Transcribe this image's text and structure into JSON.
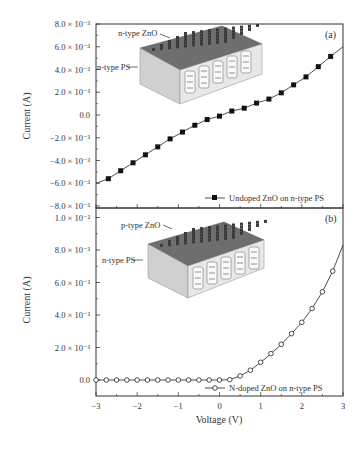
{
  "chart_data": [
    {
      "type": "line",
      "panel_label": "(a)",
      "title": "",
      "xlabel": "Voltage (V)",
      "ylabel": "Current (A)",
      "xlim": [
        -3,
        3
      ],
      "ylim": [
        -0.008,
        0.008
      ],
      "y_ticks": [
        {
          "value": 0.008,
          "label": "8.0 × 10⁻³"
        },
        {
          "value": 0.006,
          "label": "6.0 × 10⁻³"
        },
        {
          "value": 0.004,
          "label": "4.0 × 10⁻³"
        },
        {
          "value": 0.002,
          "label": "2.0 × 10⁻³"
        },
        {
          "value": 0.0,
          "label": "0.0"
        },
        {
          "value": -0.002,
          "label": "−2.0 × 10⁻³"
        },
        {
          "value": -0.004,
          "label": "−4.0 × 10⁻³"
        },
        {
          "value": -0.006,
          "label": "−6.0 × 10⁻³"
        },
        {
          "value": -0.008,
          "label": "−8.0 × 10⁻³"
        }
      ],
      "grid": false,
      "legend_position": "lower right",
      "series": [
        {
          "name": "Undoped ZnO on n-type PS",
          "marker": "filled-square",
          "line_x": [
            -3.0,
            -2.7,
            -2.4,
            -2.1,
            -1.8,
            -1.5,
            -1.2,
            -0.9,
            -0.6,
            -0.3,
            0.0,
            0.3,
            0.6,
            0.9,
            1.2,
            1.5,
            1.8,
            2.1,
            2.4,
            2.7,
            3.0
          ],
          "line_y": [
            -0.006,
            -0.0056,
            -0.0049,
            -0.0042,
            -0.0035,
            -0.0028,
            -0.0021,
            -0.0015,
            -0.0009,
            -0.0004,
            -0.0001,
            0.00035,
            0.0006,
            0.00105,
            0.0014,
            0.00195,
            0.00265,
            0.00335,
            0.00425,
            0.00515,
            0.006
          ],
          "x": [
            -2.7,
            -2.4,
            -2.1,
            -1.8,
            -1.5,
            -1.2,
            -0.9,
            -0.6,
            -0.3,
            0.0,
            0.3,
            0.6,
            0.9,
            1.2,
            1.5,
            1.8,
            2.1,
            2.4,
            2.7
          ],
          "y": [
            -0.0056,
            -0.0049,
            -0.0042,
            -0.0035,
            -0.0028,
            -0.0021,
            -0.0015,
            -0.0009,
            -0.0004,
            -0.0001,
            0.00035,
            0.0006,
            0.00105,
            0.0014,
            0.00195,
            0.00265,
            0.00335,
            0.00425,
            0.00515
          ]
        }
      ],
      "annotations": [
        {
          "text": "n-type ZnO"
        },
        {
          "text": "n-type PS"
        }
      ]
    },
    {
      "type": "line",
      "panel_label": "(b)",
      "title": "",
      "xlabel": "Voltage (V)",
      "ylabel": "Current (A)",
      "xlim": [
        -3,
        3
      ],
      "ylim": [
        -0.001,
        0.0105
      ],
      "y_ticks": [
        {
          "value": 0.01,
          "label": "1.0 × 10⁻²"
        },
        {
          "value": 0.008,
          "label": "8.0 × 10⁻³"
        },
        {
          "value": 0.006,
          "label": "6.0 × 10⁻³"
        },
        {
          "value": 0.004,
          "label": "4.0 × 10⁻³"
        },
        {
          "value": 0.002,
          "label": "2.0 × 10⁻³"
        },
        {
          "value": 0.0,
          "label": "0.0"
        }
      ],
      "x_ticks": [
        {
          "value": -3,
          "label": "−3"
        },
        {
          "value": -2,
          "label": "−2"
        },
        {
          "value": -1,
          "label": "−1"
        },
        {
          "value": 0,
          "label": "0"
        },
        {
          "value": 1,
          "label": "1"
        },
        {
          "value": 2,
          "label": "2"
        },
        {
          "value": 3,
          "label": "3"
        }
      ],
      "grid": false,
      "legend_position": "lower right",
      "series": [
        {
          "name": "N-doped ZnO on n-type PS",
          "marker": "open-circle",
          "x": [
            -3.0,
            -2.75,
            -2.5,
            -2.25,
            -2.0,
            -1.75,
            -1.5,
            -1.25,
            -1.0,
            -0.75,
            -0.5,
            -0.25,
            0.0,
            0.25,
            0.5,
            0.75,
            1.0,
            1.25,
            1.5,
            1.75,
            2.0,
            2.25,
            2.5,
            2.75
          ],
          "y": [
            0,
            0,
            0,
            0,
            0,
            0,
            0,
            0,
            0,
            0,
            0,
            0,
            0,
            2e-05,
            0.00025,
            0.0006,
            0.00109,
            0.00162,
            0.0022,
            0.00285,
            0.00355,
            0.0044,
            0.00543,
            0.0067
          ],
          "line_end": {
            "x": 3.0,
            "y": 0.0083
          }
        }
      ],
      "annotations": [
        {
          "text": "p-type ZnO"
        },
        {
          "text": "n-type PS"
        }
      ]
    }
  ],
  "labels": {
    "ylabel": "Current (A)",
    "xlabel": "Voltage (V)",
    "panel_a": "(a)",
    "panel_b": "(b)",
    "legend_a": "Undoped ZnO on n-type PS",
    "legend_b": "N-doped ZnO on n-type PS",
    "inset_a_top": "n-type ZnO",
    "inset_a_side": "n-type PS",
    "inset_b_top": "p-type ZnO",
    "inset_b_side": "n-type PS"
  },
  "colors": {
    "axis": "#333333",
    "series": "#222222",
    "inset_top": "#6e6e6e",
    "inset_side": "#e8e8e8"
  }
}
